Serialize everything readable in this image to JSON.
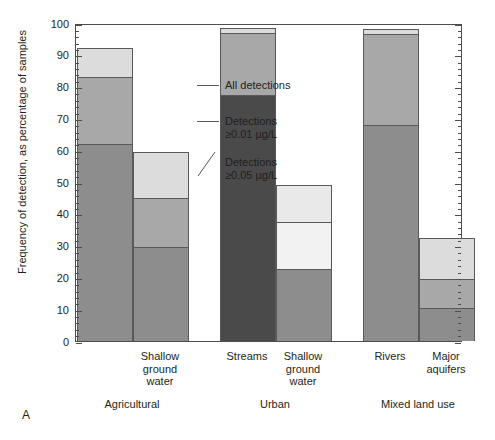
{
  "figure": {
    "panel_label": "A",
    "axis": {
      "ylabel": "Frequency of detection, as percentage of samples",
      "yticks": [
        "0",
        "10",
        "20",
        "30",
        "40",
        "50",
        "60",
        "70",
        "80",
        "90",
        "100"
      ]
    },
    "legend": {
      "all_detections": "All detections",
      "det_001_line1": "Detections",
      "det_001_line2": "≥0.01 µg/L",
      "det_005_line1": "Detections",
      "det_005_line2": "≥0.05 µg/L"
    },
    "groups": [
      {
        "name": "Agricultural"
      },
      {
        "name": "Urban"
      },
      {
        "name": "Mixed land use"
      }
    ]
  },
  "chart_data": {
    "type": "bar",
    "subtype": "stacked-bar",
    "title": "",
    "xlabel": "",
    "ylabel": "Frequency of detection, as percentage of samples",
    "ylim": [
      0,
      100
    ],
    "ytick_interval": 10,
    "yminor_tick_interval": 2,
    "grid": false,
    "legend_position": "inside-upper-left",
    "groups": [
      "Agricultural",
      "Urban",
      "Mixed land use"
    ],
    "categories": [
      "",
      "Shallow ground water",
      "Streams",
      "Shallow ground water",
      "Rivers",
      "Major aquifers"
    ],
    "bars": [
      {
        "group": "Agricultural",
        "label": "",
        "all_detections": 92.0,
        "det_0_01": 83.0,
        "det_0_05": 62.0,
        "shade": "mid"
      },
      {
        "group": "Agricultural",
        "label": "Shallow ground water",
        "all_detections": 59.5,
        "det_0_01": 45.0,
        "det_0_05": 29.5,
        "shade": "mid"
      },
      {
        "group": "Urban",
        "label": "Streams",
        "all_detections": 98.5,
        "det_0_01": 97.0,
        "det_0_05": 77.5,
        "shade": "dark"
      },
      {
        "group": "Urban",
        "label": "Shallow ground water",
        "all_detections": 49.0,
        "det_0_01": 37.5,
        "det_0_05": 22.5,
        "shade": "pale"
      },
      {
        "group": "Mixed land use",
        "label": "Rivers",
        "all_detections": 98.0,
        "det_0_01": 96.5,
        "det_0_05": 68.0,
        "shade": "mid"
      },
      {
        "group": "Mixed land use",
        "label": "Major aquifers",
        "all_detections": 32.5,
        "det_0_01": 19.5,
        "det_0_05": 10.5,
        "shade": "mid"
      }
    ],
    "series": [
      {
        "name": "All detections",
        "values": [
          92.0,
          59.5,
          98.5,
          49.0,
          98.0,
          32.5
        ]
      },
      {
        "name": "Detections ≥0.01 µg/L",
        "values": [
          83.0,
          45.0,
          97.0,
          37.5,
          96.5,
          19.5
        ]
      },
      {
        "name": "Detections ≥0.05 µg/L",
        "values": [
          62.0,
          29.5,
          77.5,
          22.5,
          68.0,
          10.5
        ]
      }
    ],
    "colors": {
      "top_segment": "#dcdcdc",
      "mid_segment_mid": "#a8a8a8",
      "bot_segment_mid": "#8d8d8d",
      "bot_segment_dark": "#4a4a4a",
      "pale_top": "#e9e9e9",
      "pale_mid": "#f2f2f2",
      "axis": "#4d4d4d"
    }
  }
}
